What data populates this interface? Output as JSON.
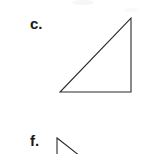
{
  "page": {
    "background_color": "#ffffff",
    "width": 161,
    "height": 154
  },
  "items": [
    {
      "id": "c",
      "label": "c.",
      "figure": {
        "name": "right-triangle",
        "shape": "triangle",
        "stroke_color": "#2b2b2b",
        "fill": "none",
        "right_angle_at": "bottom-right",
        "vertices": [
          {
            "x": 6,
            "y": 80
          },
          {
            "x": 77,
            "y": 80
          },
          {
            "x": 77,
            "y": 6
          }
        ]
      }
    },
    {
      "id": "f",
      "label": "f.",
      "figure": {
        "name": "partial-triangle-cropped",
        "shape": "triangle",
        "stroke_color": "#2b2b2b",
        "fill": "none",
        "cropped": "bottom edge of image",
        "vertices": [
          {
            "x": 7,
            "y": 6
          },
          {
            "x": 7,
            "y": 24
          },
          {
            "x": 30,
            "y": 24
          }
        ]
      }
    }
  ]
}
